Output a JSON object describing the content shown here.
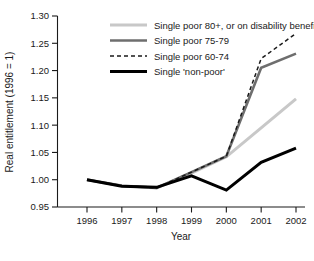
{
  "chart_data": {
    "type": "line",
    "title": "",
    "xlabel": "Year",
    "ylabel": "Real entitlement (1996 = 1)",
    "x": [
      1996,
      1997,
      1998,
      1999,
      2000,
      2001,
      2002
    ],
    "xticklabels": [
      "1996",
      "1997",
      "1998",
      "1999",
      "2000",
      "2001",
      "2002"
    ],
    "yticklabels": [
      "0.95",
      "1.00",
      "1.05",
      "1.10",
      "1.15",
      "1.20",
      "1.25",
      "1.30"
    ],
    "yticks": [
      0.95,
      1.0,
      1.05,
      1.1,
      1.15,
      1.2,
      1.25,
      1.3
    ],
    "xlim": [
      1996,
      2002
    ],
    "ylim": [
      0.95,
      1.3
    ],
    "grid": false,
    "legend_position": "top-right-inside",
    "series": [
      {
        "name": "Single poor 80+, or on disability benefits",
        "color": "#c8c8c8",
        "style": "solid",
        "width": 3.0,
        "values": [
          1.0,
          0.989,
          0.985,
          1.012,
          1.042,
          1.095,
          1.148
        ]
      },
      {
        "name": "Single poor 75-79",
        "color": "#6e6e6e",
        "style": "solid",
        "width": 2.6,
        "values": [
          1.0,
          0.989,
          0.985,
          1.014,
          1.043,
          1.205,
          1.231
        ]
      },
      {
        "name": "Single poor 60-74",
        "color": "#1a1a1a",
        "style": "dashed",
        "width": 1.5,
        "values": [
          1.0,
          0.989,
          0.985,
          1.014,
          1.043,
          1.222,
          1.268
        ]
      },
      {
        "name": "Single 'non-poor'",
        "color": "#000000",
        "style": "solid",
        "width": 3.0,
        "values": [
          1.0,
          0.988,
          0.986,
          1.007,
          0.981,
          1.032,
          1.058
        ]
      }
    ]
  },
  "legend": {
    "items": [
      {
        "label": "Single poor 80+, or on disability benefits"
      },
      {
        "label": "Single poor 75-79"
      },
      {
        "label": "Single poor 60-74"
      },
      {
        "label": "Single 'non-poor'"
      }
    ]
  }
}
